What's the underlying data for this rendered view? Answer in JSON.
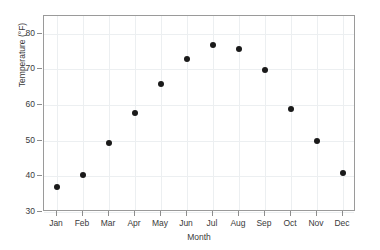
{
  "chart_data": {
    "type": "scatter",
    "title": "",
    "xlabel": "Month",
    "ylabel": "Temperature (°F)",
    "categories": [
      "Jan",
      "Feb",
      "Mar",
      "Apr",
      "May",
      "Jun",
      "Jul",
      "Aug",
      "Sep",
      "Oct",
      "Nov",
      "Dec"
    ],
    "values": [
      37.0,
      40.3,
      49.3,
      57.8,
      65.9,
      73.0,
      76.8,
      75.6,
      69.8,
      59.0,
      50.0,
      41.0
    ],
    "ylim": [
      30,
      85
    ],
    "yticks": [
      30,
      40,
      50,
      60,
      70,
      80
    ],
    "ytick_labels": [
      "30",
      "40",
      "50",
      "60",
      "70",
      "80"
    ],
    "xtick_labels": [
      "Jan",
      "Feb",
      "Mar",
      "Apr",
      "May",
      "Jun",
      "Jul",
      "Aug",
      "Sep",
      "Oct",
      "Nov",
      "Dec"
    ],
    "grid": true,
    "legend": null,
    "marker": "filled-circle",
    "marker_color": "#1a1a1a",
    "grid_color": "#eceff1",
    "axis_color": "#9a9a9a",
    "background": "#ffffff"
  }
}
